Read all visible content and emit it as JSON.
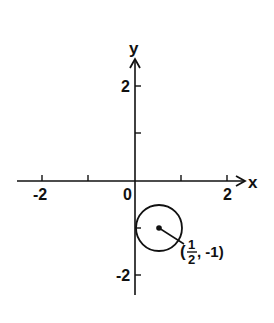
{
  "diagram": {
    "type": "coordinate-plane",
    "axes": {
      "x_label": "x",
      "y_label": "y",
      "x_ticks": [
        -2,
        -1,
        0,
        1,
        2
      ],
      "y_ticks": [
        -2,
        -1,
        1,
        2
      ],
      "x_tick_labels": {
        "neg2": "-2",
        "zero": "0",
        "pos2": "2"
      },
      "y_tick_labels": {
        "pos2": "2",
        "neg2": "-2"
      }
    },
    "circle": {
      "center": [
        0.5,
        -1
      ],
      "radius": 0.5,
      "center_label": {
        "open": "(",
        "num": "1",
        "den": "2",
        "rest": ", -1)"
      }
    },
    "colors": {
      "ink": "#111111",
      "background": "#ffffff"
    }
  }
}
